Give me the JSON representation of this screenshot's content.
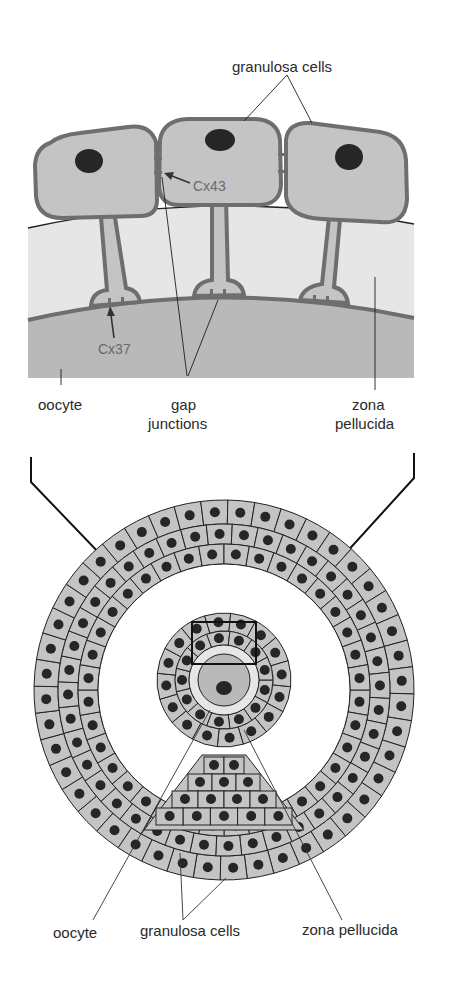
{
  "top_panel": {
    "labels": {
      "granulosa_cells": "granulosa cells",
      "cx43": "Cx43",
      "cx37": "Cx37",
      "oocyte": "oocyte",
      "gap_junctions_line1": "gap",
      "gap_junctions_line2": "junctions",
      "zona_pellucida_line1": "zona",
      "zona_pellucida_line2": "pellucida"
    }
  },
  "bottom_panel": {
    "labels": {
      "oocyte": "oocyte",
      "granulosa_cells": "granulosa cells",
      "zona_pellucida": "zona pellucida"
    }
  },
  "colors": {
    "cell_fill": "#c4c4c4",
    "cell_outline": "#6e6e6e",
    "nucleus": "#262626",
    "zona_fill": "#e6e6e6",
    "oocyte_fill": "#b9b9b9",
    "line": "#1e1e1e",
    "text": "#2a2a2a",
    "connexin_text": "#6a6a6a"
  }
}
